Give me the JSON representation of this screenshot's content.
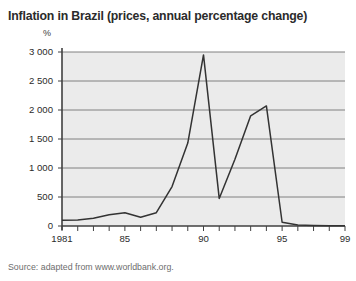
{
  "chart_data": {
    "type": "line",
    "title": "Inflation in Brazil (prices, annual percentage change)",
    "xlabel": "",
    "ylabel": "%",
    "unit_label": "%",
    "source": "Source: adapted from www.worldbank.org.",
    "xlim": [
      1981,
      1999
    ],
    "ylim": [
      0,
      3000
    ],
    "grid": true,
    "legend": false,
    "yticks": [
      0,
      500,
      1000,
      1500,
      2000,
      2500,
      3000
    ],
    "ytick_labels": [
      "0",
      "500",
      "1 000",
      "1 500",
      "2 000",
      "2 500",
      "3 000"
    ],
    "xticks": [
      1981,
      1982,
      1983,
      1984,
      1985,
      1986,
      1987,
      1988,
      1989,
      1990,
      1991,
      1992,
      1993,
      1994,
      1995,
      1996,
      1997,
      1998,
      1999
    ],
    "xtick_labels": [
      "1981",
      "",
      "",
      "",
      "85",
      "",
      "",
      "",
      "",
      "90",
      "",
      "",
      "",
      "",
      "95",
      "",
      "",
      "",
      "99"
    ],
    "x": [
      1981,
      1982,
      1983,
      1984,
      1985,
      1986,
      1987,
      1988,
      1989,
      1990,
      1991,
      1992,
      1993,
      1994,
      1995,
      1996,
      1997,
      1998,
      1999
    ],
    "values": [
      100,
      105,
      135,
      195,
      230,
      150,
      230,
      680,
      1430,
      2950,
      475,
      1150,
      1900,
      2070,
      65,
      16,
      7,
      3,
      5
    ],
    "series_name": "Brazil inflation",
    "line_color": "#333333"
  },
  "colors": {
    "plot_background": "#ebebeb",
    "page_background": "#ffffff",
    "gridline": "#808080",
    "axis": "#404040",
    "title_text": "#2b2b2b",
    "source_text": "#6d6d6d"
  }
}
